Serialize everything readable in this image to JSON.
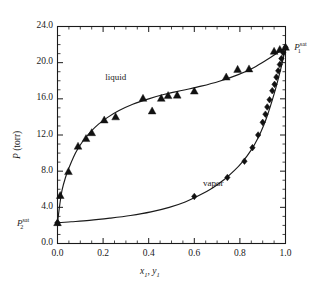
{
  "chart_data": {
    "type": "scatter",
    "title": "",
    "xlabel": "x1, y1",
    "ylabel": "P (torr)",
    "xlim": [
      0.0,
      1.0
    ],
    "ylim": [
      0.0,
      24.0
    ],
    "xticks": [
      "0.0",
      "0.2",
      "0.4",
      "0.6",
      "0.8",
      "1.0"
    ],
    "xtick_values": [
      0.0,
      0.2,
      0.4,
      0.6,
      0.8,
      1.0
    ],
    "yticks": [
      "0.0",
      "4.0",
      "8.0",
      "12.0",
      "16.0",
      "20.0",
      "24.0"
    ],
    "ytick_values": [
      0.0,
      4.0,
      8.0,
      12.0,
      16.0,
      20.0,
      24.0
    ],
    "xminor_step": 0.05,
    "yminor_step": 1.0,
    "grid": false,
    "legend": "none",
    "annotations": [
      {
        "name": "liquid-label",
        "text": "liquid",
        "x": 0.28,
        "y": 18.3
      },
      {
        "name": "vapor-label",
        "text": "vapor",
        "x": 0.7,
        "y": 6.6
      },
      {
        "name": "p1-sat-label",
        "text": "P1sat",
        "x": 1.03,
        "y": 21.7
      },
      {
        "name": "p2-sat-label",
        "text": "P2sat",
        "x": -0.02,
        "y": 2.3
      }
    ],
    "series": [
      {
        "name": "liquid",
        "marker": "triangle-up",
        "color": "#111111",
        "points": [
          {
            "x": 0.0,
            "y": 2.3
          },
          {
            "x": 0.012,
            "y": 5.3
          },
          {
            "x": 0.048,
            "y": 7.95
          },
          {
            "x": 0.09,
            "y": 10.75
          },
          {
            "x": 0.125,
            "y": 11.6
          },
          {
            "x": 0.15,
            "y": 12.25
          },
          {
            "x": 0.205,
            "y": 13.65
          },
          {
            "x": 0.255,
            "y": 14.0
          },
          {
            "x": 0.375,
            "y": 16.05
          },
          {
            "x": 0.415,
            "y": 14.65
          },
          {
            "x": 0.455,
            "y": 16.05
          },
          {
            "x": 0.485,
            "y": 16.35
          },
          {
            "x": 0.525,
            "y": 16.4
          },
          {
            "x": 0.6,
            "y": 16.85
          },
          {
            "x": 0.74,
            "y": 18.4
          },
          {
            "x": 0.79,
            "y": 19.25
          },
          {
            "x": 0.84,
            "y": 19.3
          },
          {
            "x": 0.95,
            "y": 21.25
          },
          {
            "x": 0.975,
            "y": 21.45
          },
          {
            "x": 1.0,
            "y": 21.7
          }
        ]
      },
      {
        "name": "vapor",
        "marker": "diamond",
        "color": "#111111",
        "points": [
          {
            "x": 0.0,
            "y": 2.3
          },
          {
            "x": 0.6,
            "y": 5.2
          },
          {
            "x": 0.745,
            "y": 7.3
          },
          {
            "x": 0.82,
            "y": 9.1
          },
          {
            "x": 0.855,
            "y": 10.6
          },
          {
            "x": 0.88,
            "y": 12.0
          },
          {
            "x": 0.9,
            "y": 13.4
          },
          {
            "x": 0.912,
            "y": 14.3
          },
          {
            "x": 0.92,
            "y": 15.1
          },
          {
            "x": 0.93,
            "y": 15.9
          },
          {
            "x": 0.942,
            "y": 16.9
          },
          {
            "x": 0.952,
            "y": 17.6
          },
          {
            "x": 0.96,
            "y": 18.4
          },
          {
            "x": 0.968,
            "y": 19.1
          },
          {
            "x": 0.975,
            "y": 19.8
          },
          {
            "x": 0.982,
            "y": 20.45
          },
          {
            "x": 0.99,
            "y": 21.1
          },
          {
            "x": 1.0,
            "y": 21.7
          }
        ]
      }
    ],
    "curves": [
      {
        "name": "liquid-curve",
        "points": [
          {
            "x": 0.0,
            "y": 2.3
          },
          {
            "x": 0.01,
            "y": 4.3
          },
          {
            "x": 0.02,
            "y": 5.9
          },
          {
            "x": 0.035,
            "y": 7.3
          },
          {
            "x": 0.05,
            "y": 8.35
          },
          {
            "x": 0.07,
            "y": 9.55
          },
          {
            "x": 0.09,
            "y": 10.5
          },
          {
            "x": 0.115,
            "y": 11.45
          },
          {
            "x": 0.145,
            "y": 12.35
          },
          {
            "x": 0.18,
            "y": 13.2
          },
          {
            "x": 0.22,
            "y": 13.95
          },
          {
            "x": 0.27,
            "y": 14.7
          },
          {
            "x": 0.33,
            "y": 15.4
          },
          {
            "x": 0.4,
            "y": 16.0
          },
          {
            "x": 0.47,
            "y": 16.5
          },
          {
            "x": 0.55,
            "y": 16.95
          },
          {
            "x": 0.63,
            "y": 17.4
          },
          {
            "x": 0.71,
            "y": 17.95
          },
          {
            "x": 0.79,
            "y": 18.65
          },
          {
            "x": 0.86,
            "y": 19.45
          },
          {
            "x": 0.92,
            "y": 20.35
          },
          {
            "x": 0.965,
            "y": 21.1
          },
          {
            "x": 1.0,
            "y": 21.7
          }
        ]
      },
      {
        "name": "vapor-curve",
        "points": [
          {
            "x": 0.0,
            "y": 2.3
          },
          {
            "x": 0.06,
            "y": 2.4
          },
          {
            "x": 0.14,
            "y": 2.55
          },
          {
            "x": 0.23,
            "y": 2.8
          },
          {
            "x": 0.32,
            "y": 3.1
          },
          {
            "x": 0.41,
            "y": 3.5
          },
          {
            "x": 0.49,
            "y": 4.0
          },
          {
            "x": 0.56,
            "y": 4.6
          },
          {
            "x": 0.62,
            "y": 5.3
          },
          {
            "x": 0.68,
            "y": 6.15
          },
          {
            "x": 0.73,
            "y": 7.05
          },
          {
            "x": 0.775,
            "y": 8.05
          },
          {
            "x": 0.815,
            "y": 9.15
          },
          {
            "x": 0.85,
            "y": 10.35
          },
          {
            "x": 0.88,
            "y": 11.7
          },
          {
            "x": 0.905,
            "y": 13.1
          },
          {
            "x": 0.925,
            "y": 14.5
          },
          {
            "x": 0.942,
            "y": 15.85
          },
          {
            "x": 0.957,
            "y": 17.15
          },
          {
            "x": 0.97,
            "y": 18.4
          },
          {
            "x": 0.982,
            "y": 19.6
          },
          {
            "x": 0.992,
            "y": 20.7
          },
          {
            "x": 1.0,
            "y": 21.7
          }
        ]
      }
    ]
  },
  "axes": {
    "ylabel_prefix": "P",
    "ylabel_unit": "(torr)",
    "xlabel_x": "x",
    "xlabel_x_sub": "1",
    "xlabel_comma": ", ",
    "xlabel_y": "y",
    "xlabel_y_sub": "1"
  },
  "labels": {
    "liquid": "liquid",
    "vapor": "vapor",
    "p_sat_symbol": "P",
    "p1_sub": "1",
    "p2_sub": "2",
    "sat_sup": "sat"
  },
  "colors": {
    "axis": "#1a1a1a",
    "marker": "#111111",
    "curve": "#1a1a1a",
    "background": "#ffffff"
  }
}
